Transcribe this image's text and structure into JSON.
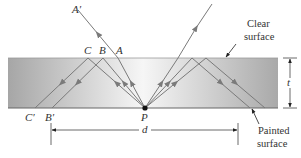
{
  "diagram": {
    "labels": {
      "A_prime": "A′",
      "A": "A",
      "B": "B",
      "C": "C",
      "B_prime": "B′",
      "C_prime": "C′",
      "P": "P",
      "d": "d",
      "t": "t"
    },
    "annotations": {
      "clear_line1": "Clear",
      "clear_line2": "surface",
      "painted_line1": "Painted",
      "painted_line2": "surface"
    },
    "colors": {
      "slab_dark": "#a8a8a8",
      "slab_light": "#f4f4f4",
      "ray": "#7a7a7a",
      "text": "#333333",
      "point": "#111111"
    }
  }
}
